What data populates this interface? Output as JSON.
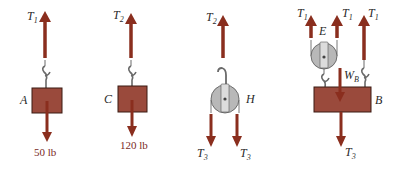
{
  "colors": {
    "arrow": "#8a2e1e",
    "block_fill": "#9a4a3c",
    "block_stroke": "#3a1a12",
    "pulley_fill": "#b8b8b8",
    "pulley_stroke": "#555555",
    "hook": "#6a6a6a",
    "label": "#2a2a2a",
    "weight_label": "#7a2a1e"
  },
  "diagrams": [
    {
      "id": "A",
      "body_label": "A",
      "type": "block",
      "up_force": {
        "symbol": "T",
        "sub": "1"
      },
      "down_force": {
        "label": "50 lb"
      }
    },
    {
      "id": "C",
      "body_label": "C",
      "type": "block",
      "up_force": {
        "symbol": "T",
        "sub": "2"
      },
      "down_force": {
        "label": "120 lb"
      }
    },
    {
      "id": "H",
      "body_label": "H",
      "type": "pulley",
      "up_force": {
        "symbol": "T",
        "sub": "2"
      },
      "down_forces": [
        {
          "symbol": "T",
          "sub": "3"
        },
        {
          "symbol": "T",
          "sub": "3"
        }
      ]
    },
    {
      "id": "B",
      "body_label": "B",
      "pulley_label": "E",
      "type": "block_with_pulley",
      "up_forces": [
        {
          "symbol": "T",
          "sub": "1"
        },
        {
          "symbol": "T",
          "sub": "1"
        },
        {
          "symbol": "T",
          "sub": "1"
        }
      ],
      "weight": {
        "symbol": "W",
        "sub": "B"
      },
      "down_force": {
        "symbol": "T",
        "sub": "3"
      }
    }
  ]
}
